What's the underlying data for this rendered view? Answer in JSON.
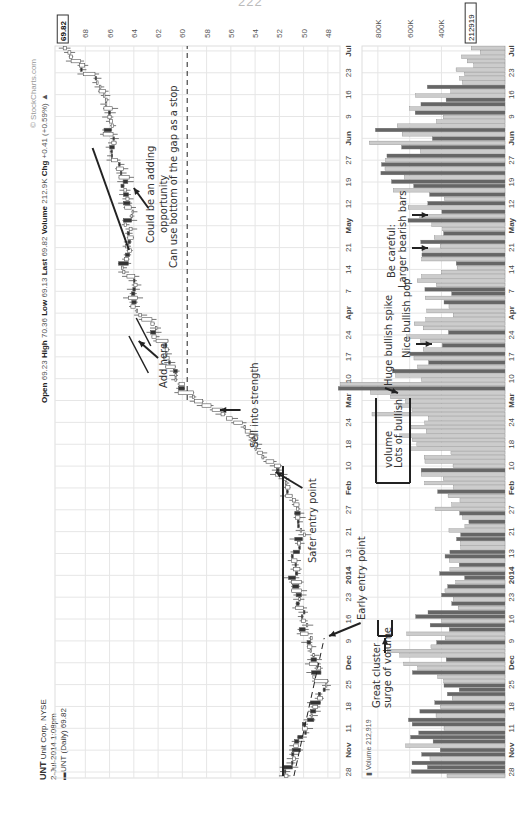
{
  "page_number": "222",
  "header": {
    "symbol": "UNT",
    "company": "Unit Corp.",
    "exchange": "NYSE",
    "datetime": "2-Jul-2014 1:08pm",
    "series_label": "UNT (Daily) 69.82",
    "open_label": "Open",
    "open": "69.23",
    "high_label": "High",
    "high": "70.36",
    "low_label": "Low",
    "low": "69.13",
    "last_label": "Last",
    "last": "69.82",
    "volume_label": "Volume",
    "volume": "212.9K",
    "chg_label": "Chg",
    "chg": "+0.41 (+0.59%)",
    "chg_arrow": "▲",
    "copyright": "© StockCharts.com"
  },
  "price_panel": {
    "last_price_badge": "69.82",
    "y_ticks": [
      "68",
      "66",
      "64",
      "62",
      "60",
      "58",
      "56",
      "54",
      "52",
      "50",
      "48"
    ]
  },
  "volume_panel": {
    "legend": "Volume 212,919",
    "last_volume_badge": "212919",
    "y_ticks": [
      "800K",
      "600K",
      "400K"
    ]
  },
  "x_axis": {
    "labels": [
      "28",
      "Nov",
      "11",
      "18",
      "25",
      "Dec",
      "9",
      "16",
      "23",
      "2014",
      "13",
      "21",
      "27",
      "Feb",
      "10",
      "18",
      "24",
      "Mar",
      "10",
      "17",
      "24",
      "Apr",
      "7",
      "14",
      "21",
      "May",
      "12",
      "19",
      "27",
      "Jun",
      "9",
      "16",
      "23",
      "Jul"
    ],
    "bold": [
      "Nov",
      "Dec",
      "2014",
      "Feb",
      "Mar",
      "Apr",
      "May",
      "Jun",
      "Jul"
    ]
  },
  "annotations": {
    "early_entry": "Early entry point",
    "safer_entry": "Safer entry point",
    "sell_strength": "Sell into strength",
    "add_here": "Add here",
    "gap_stop": "Can use bottom of the gap as a stop",
    "adding_1": "Could be an adding",
    "adding_2": "opportunity",
    "great_cluster_1": "Great cluster",
    "great_cluster_2": "surge of volume",
    "lots_bullish_1": "Lots of bullish",
    "lots_bullish_2": "volume",
    "huge_spike": "Huge bullish spike",
    "nice_pop": "Nice bullish pop",
    "careful_1": "Be careful:",
    "careful_2": "Larger bearish bars"
  },
  "colors": {
    "bull_candle": "#ffffff",
    "bear_candle": "#333333",
    "bull_volume": "#cccccc",
    "bear_volume": "#666666",
    "grid": "#e6e6e6"
  },
  "chart_data": {
    "type": "candlestick",
    "xlabel": "",
    "ylabel": "Price",
    "ylim": [
      47,
      70.5
    ],
    "grid": true,
    "period": "28 Oct 2013 – 2 Jul 2014",
    "price_path_approx": {
      "dates": [
        "Oct 28",
        "Nov 11",
        "Nov 25",
        "Dec 9",
        "Dec 23",
        "Jan 13",
        "Jan 27",
        "Feb 10",
        "Feb 24",
        "Mar 3",
        "Mar 17",
        "Apr 7",
        "Apr 21",
        "May 5",
        "May 19",
        "Jun 2",
        "Jun 16",
        "Jul 2"
      ],
      "close": [
        51.6,
        50.0,
        48.5,
        49.5,
        50.5,
        50.8,
        50.2,
        52.0,
        54.5,
        60.2,
        61.5,
        64.0,
        64.8,
        64.5,
        65.0,
        66.2,
        66.5,
        69.8
      ]
    },
    "volume_series_approx_K": {
      "dates": [
        "Oct 28",
        "Nov 11",
        "Nov 25",
        "Dec 9",
        "Dec 23",
        "Jan 13",
        "Jan 27",
        "Feb 10",
        "Feb 24",
        "Mar 3",
        "Mar 17",
        "Apr 7",
        "Apr 21",
        "May 5",
        "May 12",
        "Jun 2",
        "Jun 16",
        "Jul 2"
      ],
      "values": [
        500,
        560,
        380,
        620,
        400,
        360,
        340,
        420,
        560,
        900,
        520,
        480,
        430,
        520,
        640,
        700,
        430,
        213
      ]
    },
    "last": {
      "open": 69.23,
      "high": 70.36,
      "low": 69.13,
      "close": 69.82,
      "volume": 212919
    }
  }
}
